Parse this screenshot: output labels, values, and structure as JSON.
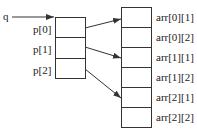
{
  "pointer_label": "q",
  "left_array": {
    "cells": [
      "p[0]",
      "p[1]",
      "p[2]"
    ]
  },
  "right_array": {
    "cells": [
      "arr[0][1]",
      "arr[0][2]",
      "arr[1][1]",
      "arr[1][2]",
      "arr[2][1]",
      "arr[2][2]"
    ]
  },
  "colors": {
    "line": "#333333",
    "background": "#ffffff"
  }
}
